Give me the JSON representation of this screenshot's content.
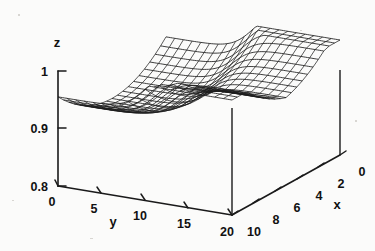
{
  "figure": {
    "background_color": "#fbfbfa",
    "ink_color": "#1a1a1a",
    "width": 375,
    "height": 251,
    "style": "wireframe-mesh-3d"
  },
  "axis_titles": {
    "x": "x",
    "y": "y",
    "z": "z"
  },
  "chart_data": {
    "type": "surface",
    "title": "",
    "subtitle": "",
    "xlabel": "x",
    "ylabel": "y",
    "zlabel": "z",
    "xlim": [
      0,
      10
    ],
    "ylim": [
      0,
      20
    ],
    "zlim": [
      0.8,
      1.0
    ],
    "xticks": [
      0,
      2,
      4,
      6,
      8,
      10
    ],
    "yticks": [
      0,
      5,
      10,
      15,
      20
    ],
    "zticks": [
      0.8,
      0.9,
      1.0
    ],
    "xtick_labels": [
      "0",
      "2",
      "4",
      "6",
      "8",
      "10"
    ],
    "ytick_labels": [
      "0",
      "5",
      "10",
      "15",
      "20"
    ],
    "ztick_labels": [
      "0.8",
      "0.9",
      "1"
    ],
    "grid": false,
    "legend": false,
    "legend_position": "none",
    "projection": "gnuplot-default-3d",
    "view_rotation_deg": 60,
    "view_azimuth_deg": 30,
    "mesh_rows": 21,
    "mesh_cols": 21,
    "surface_description": "Sigmoid ridge rising sharply along y near y=10, with parabolic valleys along x on both plateaus",
    "z_min_observed": 0.8,
    "z_max_observed": 1.0,
    "annotations": []
  }
}
